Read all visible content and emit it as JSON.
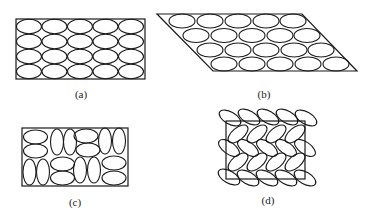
{
  "figure": {
    "panels": [
      {
        "id": "a",
        "label": "(a)",
        "description": "Rectangular array of horizontally aligned ellipses, 5 columns x 4 rows",
        "shape": "rectangle",
        "rows": 4,
        "cols": 5,
        "orientation": "horizontal"
      },
      {
        "id": "b",
        "label": "(b)",
        "description": "Parallelogram array of horizontally aligned ellipses in staggered rows, 5 per row x 4 rows",
        "shape": "parallelogram",
        "rows": 4,
        "cols": 5,
        "orientation": "horizontal-staggered"
      },
      {
        "id": "c",
        "label": "(c)",
        "description": "Rectangle filled with randomly oriented ellipses (mix of horizontal and vertical)",
        "shape": "rectangle",
        "orientation": "random"
      },
      {
        "id": "d",
        "label": "(d)",
        "description": "Rectangle with tilted ellipses in a herringbone arrangement, extending beyond the border",
        "shape": "rectangle",
        "rows": 5,
        "cols": 5,
        "orientation": "tilted"
      }
    ],
    "colors": {
      "stroke": "#1a1a1a",
      "background": "#ffffff"
    }
  }
}
